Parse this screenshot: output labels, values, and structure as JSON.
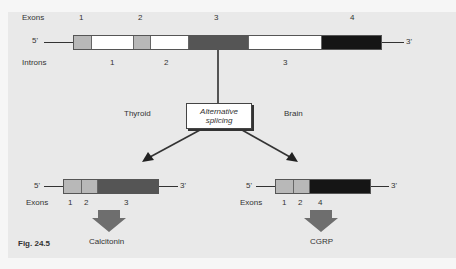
{
  "figure": {
    "label": "Fig. 24.5",
    "colors": {
      "background": "#e9e9e9",
      "exon_light": "#b8b8b8",
      "exon_3": "#555555",
      "exon_4": "#151515",
      "intron": "#ffffff",
      "arrow_fill": "#6e6e6e"
    }
  },
  "gene": {
    "exons_label": "Exons",
    "introns_label": "Introns",
    "five_prime": "5'",
    "three_prime": "3'",
    "exon_numbers": [
      "1",
      "2",
      "3",
      "4"
    ],
    "intron_numbers": [
      "1",
      "2",
      "3"
    ]
  },
  "splicing": {
    "box_line1": "Alternative",
    "box_line2": "splicing",
    "left_tissue": "Thyroid",
    "right_tissue": "Brain"
  },
  "products": {
    "left": {
      "five_prime": "5'",
      "three_prime": "3'",
      "exons_label": "Exons",
      "exon_numbers": [
        "1",
        "2",
        "3"
      ],
      "product_name": "Calcitonin"
    },
    "right": {
      "five_prime": "5'",
      "three_prime": "3'",
      "exons_label": "Exons",
      "exon_numbers": [
        "1",
        "2",
        "4"
      ],
      "product_name": "CGRP"
    }
  }
}
